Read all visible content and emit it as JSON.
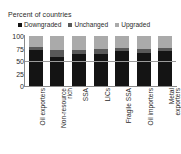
{
  "chart_data": {
    "type": "bar",
    "subtype": "stacked-bar-100",
    "title": "",
    "ylabel": "Percent of countries",
    "xlabel": "",
    "ylim": [
      0,
      100
    ],
    "yticks": [
      100,
      75,
      50,
      25,
      0
    ],
    "grid": false,
    "reference_line": 50,
    "legend_position": "top",
    "categories": [
      "Oil exporters",
      "Non-resource rich",
      "SSA",
      "LICs",
      "Fragile SSA",
      "Oil importers",
      "Metal exporters"
    ],
    "series": [
      {
        "name": "Downgraded",
        "color": "#141414",
        "values": [
          73,
          59,
          65,
          64,
          71,
          66,
          71
        ]
      },
      {
        "name": "Unchanged",
        "color": "#595959",
        "values": [
          5,
          14,
          7,
          10,
          5,
          9,
          6
        ]
      },
      {
        "name": "Upgraded",
        "color": "#aaaaaa",
        "values": [
          22,
          27,
          28,
          26,
          24,
          25,
          23
        ]
      }
    ]
  },
  "axis": {
    "y_title": "Percent of countries",
    "ticks": [
      "100",
      "75",
      "50",
      "25",
      "0"
    ]
  },
  "legend": {
    "items": [
      {
        "label": "Downgraded",
        "color": "#141414"
      },
      {
        "label": "Unchanged",
        "color": "#595959"
      },
      {
        "label": "Upgraded",
        "color": "#aaaaaa"
      }
    ]
  },
  "xlabels": [
    {
      "lines": [
        "Oil exporters"
      ]
    },
    {
      "lines": [
        "Non-resource",
        "rich"
      ]
    },
    {
      "lines": [
        "SSA"
      ]
    },
    {
      "lines": [
        "LICs"
      ]
    },
    {
      "lines": [
        "Fragile SSA"
      ]
    },
    {
      "lines": [
        "Oil importers"
      ]
    },
    {
      "lines": [
        "Metal",
        "exporters"
      ]
    }
  ],
  "colors": {
    "downgraded": "#141414",
    "unchanged": "#595959",
    "upgraded": "#aaaaaa",
    "axis": "#8a8a8a",
    "refline": "#9a9a9a",
    "text": "#2b2b2b",
    "background": "#ffffff"
  }
}
